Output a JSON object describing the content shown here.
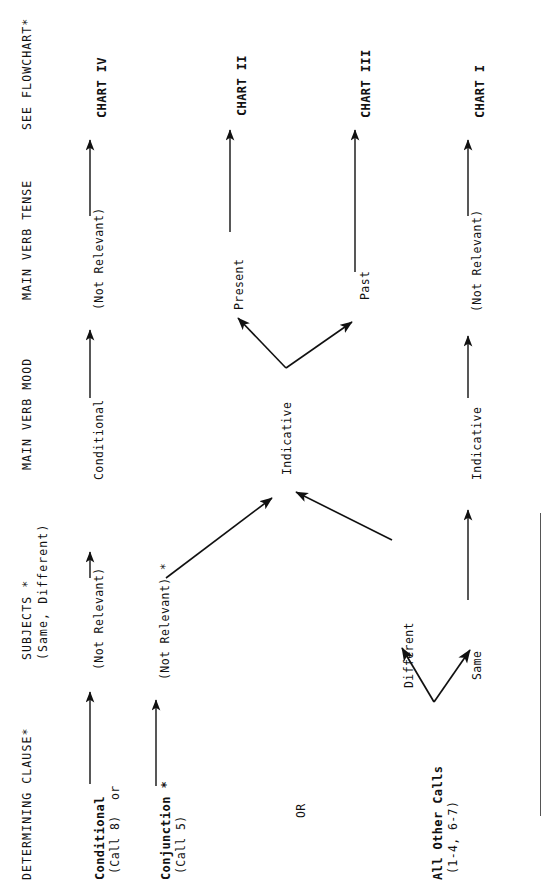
{
  "page": {
    "width": 548,
    "height": 894,
    "background": "#ffffff",
    "ink": "#111111",
    "orientation": "rotated-90-ccw"
  },
  "headers": [
    {
      "id": "determining-clause",
      "label": "DETERMINING CLAUSE*"
    },
    {
      "id": "subjects",
      "label": "SUBJECTS *"
    },
    {
      "id": "subjects-sub",
      "label": "(Same, Different)"
    },
    {
      "id": "main-verb-mood",
      "label": "MAIN VERB MOOD"
    },
    {
      "id": "main-verb-tense",
      "label": "MAIN VERB TENSE"
    },
    {
      "id": "see-flowchart",
      "label": "SEE FLOWCHART*"
    }
  ],
  "rows": [
    {
      "id": "conditional",
      "source": "Conditional",
      "source_sub": "(Call 8)",
      "subjects": "(Not Relevant)",
      "mood": "Conditional",
      "tense": "(Not Relevant)",
      "result": "CHART IV"
    },
    {
      "id": "conjunction",
      "source": "Conjunction *",
      "source_sub": "(Call 5)",
      "subjects": "(Not Relevant) *",
      "mood": "Indicative",
      "tense_present": "Present",
      "tense_past": "Past",
      "result_present": "CHART II",
      "result_past": "CHART III"
    },
    {
      "id": "all-other-calls",
      "source": "All Other Calls",
      "source_sub": "(1-4, 6-7)",
      "subjects_different": "Different",
      "subjects_same": "Same",
      "mood": "Indicative",
      "tense": "(Not Relevant)",
      "result": "CHART I"
    }
  ],
  "connectors": {
    "or_lower": "or",
    "or_upper": "OR"
  },
  "nodes": {
    "indicative_shared": "Indicative",
    "present": "Present",
    "past": "Past",
    "chart_i": "CHART I",
    "chart_ii": "CHART II",
    "chart_iii": "CHART III",
    "chart_iv": "CHART IV"
  }
}
